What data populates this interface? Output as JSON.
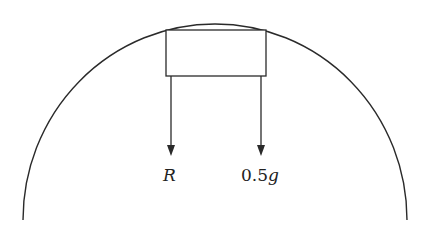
{
  "diagram": {
    "labels": {
      "force_left": "R",
      "force_right": "0.5g"
    },
    "colors": {
      "stroke": "#2a2a2a",
      "background": "#ffffff"
    }
  }
}
